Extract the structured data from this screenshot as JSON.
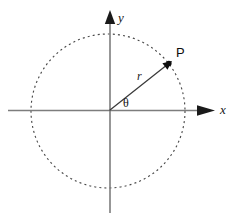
{
  "figure": {
    "kind": "polar-coordinate-diagram",
    "width": 234,
    "height": 222,
    "background_color": "#ffffff"
  },
  "colors": {
    "axis": "#7d7d7d",
    "circle": "#4a4a4a",
    "vector": "#3a3a3a",
    "label": "#111111",
    "arrowhead": "#0d0d0d"
  },
  "labels": {
    "x_axis": "x",
    "y_axis": "y",
    "radius": "r",
    "angle": "θ",
    "point": "P"
  },
  "chart_data": {
    "type": "scatter",
    "title": "",
    "xlabel": "x",
    "ylabel": "y",
    "grid": false,
    "legend": null,
    "origin": {
      "x": 110,
      "y": 110
    },
    "circle": {
      "label": "",
      "center_x": 108,
      "center_y": 111,
      "radius": 77,
      "style": "dashed"
    },
    "axes": {
      "x_start_x": 8,
      "x_end_x": 215,
      "x_y": 110,
      "y_top_y": 10,
      "y_bottom_y": 213,
      "y_x": 110,
      "arrowheads": [
        "x-positive",
        "y-positive"
      ]
    },
    "annotations": [
      {
        "name": "radius-vector",
        "text": "r",
        "from_x": 110,
        "from_y": 110,
        "to_x": 172,
        "to_y": 61,
        "label_x": 140,
        "label_y": 76
      },
      {
        "name": "angle-theta",
        "text": "θ",
        "label_x": 124,
        "label_y": 100,
        "value_deg": 38
      },
      {
        "name": "point-P",
        "text": "P",
        "x": 172,
        "y": 61,
        "label_x": 177,
        "label_y": 48
      }
    ]
  }
}
